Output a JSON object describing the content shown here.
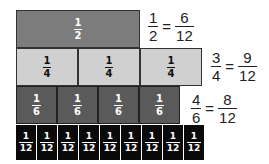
{
  "rows": {
    "half": {
      "count": 1,
      "numerator": "1",
      "denominator": "2",
      "color": "#7c7c7c"
    },
    "quarter": {
      "count": 3,
      "numerator": "1",
      "denominator": "4",
      "color": "#d0d0d0"
    },
    "sixth": {
      "count": 4,
      "numerator": "1",
      "denominator": "6",
      "color": "#5a5a5a"
    },
    "twelfth": {
      "count": 9,
      "numerator": "1",
      "denominator": "12",
      "color": "#0a0a0a"
    }
  },
  "equations": [
    {
      "left_num": "1",
      "left_den": "2",
      "equals": "=",
      "right_num": "6",
      "right_den": "12"
    },
    {
      "left_num": "3",
      "left_den": "4",
      "equals": "=",
      "right_num": "9",
      "right_den": "12"
    },
    {
      "left_num": "4",
      "left_den": "6",
      "equals": "=",
      "right_num": "8",
      "right_den": "12"
    }
  ]
}
